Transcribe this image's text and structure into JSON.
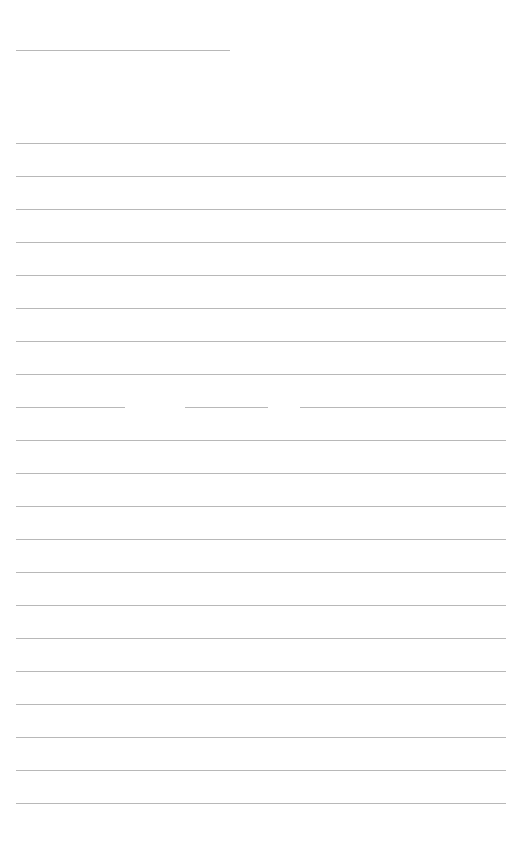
{
  "page": {
    "type": "blank lined writing sheet",
    "background": "#ffffff",
    "line_color": "#b8b8b8",
    "header_line": {
      "y": 50,
      "x_start": 16,
      "x_end": 230
    },
    "ruled_lines": {
      "x_start": 16,
      "x_end": 506,
      "first_y": 143,
      "spacing": 33,
      "count": 21
    },
    "broken_line": {
      "y": 407,
      "segments": [
        [
          16,
          125
        ],
        [
          185,
          268
        ],
        [
          300,
          506
        ]
      ]
    }
  }
}
